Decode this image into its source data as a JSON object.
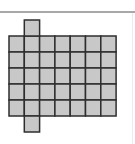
{
  "figure": {
    "grid": {
      "columns": 7,
      "rows": 5,
      "origin_x": 9,
      "origin_y": 36,
      "cell_width": 15.3,
      "cell_height": 16
    },
    "extra_cells": [
      {
        "position": "above",
        "column": 1
      },
      {
        "position": "below",
        "column": 1
      }
    ],
    "colors": {
      "cell_fill": "#c8c8c8",
      "cell_stroke": "#2e2e2e",
      "top_rule": "#a8a8a8",
      "background": "#ffffff"
    }
  }
}
